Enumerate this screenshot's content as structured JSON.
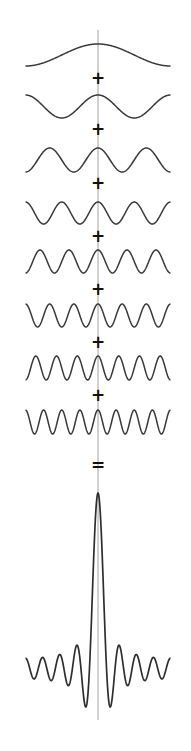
{
  "colors": {
    "wave": "#3a3a3a",
    "axis": "#8a8a8a",
    "operator": "#111111",
    "background": "#ffffff"
  },
  "layout": {
    "x_left": 26,
    "x_right": 171,
    "center_x": 98,
    "axis_top": 30,
    "axis_bottom": 720
  },
  "harmonics": [
    {
      "k": 1,
      "peak_y": 44,
      "trough_y": 66
    },
    {
      "k": 2,
      "peak_y": 95,
      "trough_y": 118
    },
    {
      "k": 3,
      "peak_y": 148,
      "trough_y": 172
    },
    {
      "k": 4,
      "peak_y": 202,
      "trough_y": 224
    },
    {
      "k": 5,
      "peak_y": 250,
      "trough_y": 273
    },
    {
      "k": 6,
      "peak_y": 304,
      "trough_y": 327
    },
    {
      "k": 7,
      "peak_y": 356,
      "trough_y": 380
    },
    {
      "k": 8,
      "peak_y": 410,
      "trough_y": 434
    }
  ],
  "operators": [
    {
      "symbol": "+",
      "y": 78
    },
    {
      "symbol": "+",
      "y": 129
    },
    {
      "symbol": "+",
      "y": 183
    },
    {
      "symbol": "+",
      "y": 236
    },
    {
      "symbol": "+",
      "y": 289
    },
    {
      "symbol": "+",
      "y": 342
    },
    {
      "symbol": "+",
      "y": 395
    },
    {
      "symbol": "=",
      "y": 465
    }
  ],
  "sum": {
    "peak_y": 493,
    "baseline_y": 662,
    "min_y": 707,
    "harmonics": 8
  }
}
